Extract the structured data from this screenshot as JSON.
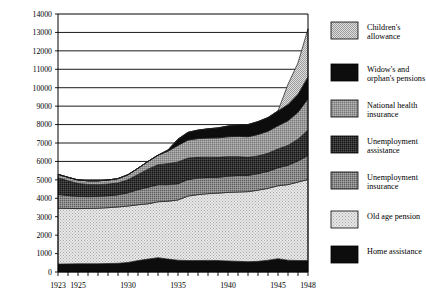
{
  "chart_data": {
    "type": "area",
    "title": "",
    "xlabel": "",
    "ylabel": "",
    "stacked": true,
    "grid": true,
    "legend_position": "right",
    "xlim": [
      1923,
      1948
    ],
    "ylim": [
      0,
      14000
    ],
    "y_ticks": [
      0,
      1000,
      2000,
      3000,
      4000,
      5000,
      6000,
      7000,
      8000,
      9000,
      10000,
      11000,
      12000,
      13000,
      14000
    ],
    "x_ticks": [
      1923,
      1924,
      1925,
      1926,
      1927,
      1928,
      1929,
      1930,
      1931,
      1932,
      1933,
      1934,
      1935,
      1936,
      1937,
      1938,
      1939,
      1940,
      1941,
      1942,
      1943,
      1944,
      1945,
      1946,
      1947,
      1948
    ],
    "x_tick_labels": [
      "1923",
      "1925",
      "1930",
      "1935",
      "1940",
      "1945",
      "1948"
    ],
    "x_tick_label_values": [
      1923,
      1925,
      1930,
      1935,
      1940,
      1945,
      1948
    ],
    "x": [
      1923,
      1924,
      1925,
      1926,
      1927,
      1928,
      1929,
      1930,
      1931,
      1932,
      1933,
      1934,
      1935,
      1936,
      1937,
      1938,
      1939,
      1940,
      1941,
      1942,
      1943,
      1944,
      1945,
      1946,
      1947,
      1948
    ],
    "series": [
      {
        "name": "Home assistance",
        "color": "#0d0d0d",
        "pattern": "solid-black",
        "values": [
          430,
          440,
          450,
          450,
          450,
          460,
          470,
          520,
          620,
          700,
          780,
          700,
          640,
          620,
          620,
          630,
          620,
          600,
          580,
          560,
          580,
          640,
          720,
          640,
          620,
          620
        ]
      },
      {
        "name": "Old age pension",
        "color": "#d6d6d6",
        "pattern": "light-dots",
        "values": [
          3030,
          3010,
          2990,
          3000,
          3010,
          3030,
          3060,
          3060,
          3030,
          3000,
          3030,
          3140,
          3270,
          3500,
          3580,
          3620,
          3660,
          3720,
          3760,
          3800,
          3860,
          3900,
          3960,
          4100,
          4260,
          4400
        ]
      },
      {
        "name": "Unemployment insurance",
        "color": "#8c8c8c",
        "pattern": "mid-check",
        "values": [
          750,
          700,
          660,
          640,
          640,
          650,
          660,
          720,
          820,
          900,
          930,
          900,
          880,
          900,
          900,
          880,
          860,
          880,
          900,
          880,
          900,
          920,
          980,
          1050,
          1150,
          1300
        ]
      },
      {
        "name": "Unemployment assistance",
        "color": "#3a3a3a",
        "pattern": "dark-check",
        "values": [
          900,
          800,
          700,
          660,
          640,
          630,
          640,
          700,
          820,
          980,
          1080,
          1140,
          1180,
          1160,
          1120,
          1100,
          1080,
          1060,
          1020,
          980,
          960,
          980,
          1020,
          1080,
          1180,
          1380
        ]
      },
      {
        "name": "National health insurance",
        "color": "#9a9a9a",
        "pattern": "mid-grey",
        "values": [
          190,
          190,
          195,
          200,
          210,
          220,
          240,
          280,
          340,
          420,
          520,
          680,
          900,
          980,
          1020,
          1040,
          1060,
          1080,
          1100,
          1120,
          1160,
          1200,
          1260,
          1340,
          1460,
          1700
        ]
      },
      {
        "name": "Widow's and orphan's pensions",
        "color": "#0d0d0d",
        "pattern": "solid-black",
        "values": [
          0,
          0,
          0,
          0,
          0,
          0,
          0,
          0,
          0,
          0,
          0,
          60,
          340,
          420,
          460,
          500,
          540,
          580,
          620,
          660,
          700,
          740,
          800,
          880,
          980,
          1200
        ]
      },
      {
        "name": "Children's allowance",
        "color": "#cfcfcf",
        "pattern": "light-check",
        "values": [
          0,
          0,
          0,
          0,
          0,
          0,
          0,
          0,
          0,
          0,
          0,
          0,
          0,
          0,
          0,
          0,
          0,
          0,
          0,
          0,
          0,
          0,
          0,
          1100,
          1700,
          2600
        ]
      }
    ],
    "totals": [
      5300,
      5140,
      4995,
      4950,
      4950,
      4990,
      5070,
      5280,
      5630,
      6000,
      6340,
      6620,
      7210,
      7580,
      7700,
      7770,
      7820,
      7920,
      7980,
      8000,
      8160,
      8380,
      8740,
      10190,
      11350,
      13200
    ]
  },
  "legend": {
    "items": [
      {
        "label_line1": "Children's",
        "label_line2": "allowance",
        "key": "childrens-allowance"
      },
      {
        "label_line1": "Widow's and",
        "label_line2": "orphan's pensions",
        "key": "widows-orphans-pensions"
      },
      {
        "label_line1": "National health",
        "label_line2": "insurance",
        "key": "national-health-insurance"
      },
      {
        "label_line1": "Unemployment",
        "label_line2": "assistance",
        "key": "unemployment-assistance"
      },
      {
        "label_line1": "Unemployment",
        "label_line2": "insurance",
        "key": "unemployment-insurance"
      },
      {
        "label_line1": "Old age pension",
        "label_line2": "",
        "key": "old-age-pension"
      },
      {
        "label_line1": "Home assistance",
        "label_line2": "",
        "key": "home-assistance"
      }
    ]
  }
}
